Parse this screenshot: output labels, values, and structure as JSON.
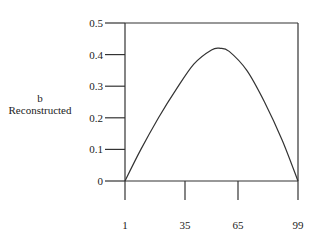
{
  "chart_data": {
    "type": "line",
    "title": "",
    "ylabel_line1": "b",
    "ylabel_line2": "Reconstructed",
    "xlabel": "",
    "xlim": [
      1,
      99
    ],
    "ylim": [
      0,
      0.5
    ],
    "xticks": [
      "1",
      "35",
      "65",
      "99"
    ],
    "yticks": [
      "0",
      "0.1",
      "0.2",
      "0.3",
      "0.4",
      "0.5"
    ],
    "grid": false,
    "legend": null,
    "series": [
      {
        "name": "b Reconstructed",
        "x": [
          1,
          10,
          20,
          30,
          40,
          50,
          55,
          60,
          70,
          80,
          90,
          99
        ],
        "y": [
          0.0,
          0.1,
          0.2,
          0.29,
          0.37,
          0.415,
          0.42,
          0.41,
          0.35,
          0.25,
          0.13,
          0.0
        ]
      }
    ],
    "peak": {
      "x": 52,
      "y": 0.42
    }
  }
}
